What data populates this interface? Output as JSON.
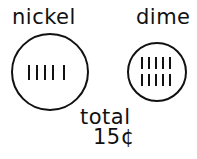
{
  "coins": [
    {
      "label": "nickel",
      "tally": 5,
      "tally_rows": 1
    },
    {
      "label": "dime",
      "tally": 10,
      "tally_rows": 2
    }
  ],
  "total": {
    "label": "total",
    "value": "15¢"
  }
}
